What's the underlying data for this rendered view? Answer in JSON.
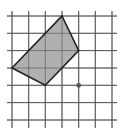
{
  "diagram": {
    "type": "grid-polygon",
    "grid": {
      "x_lines": [
        12,
        28.7,
        45.3,
        62,
        78.7,
        95.3,
        112
      ],
      "y_lines": [
        16,
        33.3,
        50.6,
        68,
        85.3,
        102.6,
        120
      ],
      "x_extent": [
        7,
        117
      ],
      "y_extent": [
        11,
        128
      ],
      "line_color": "#555555",
      "line_width": 0.9
    },
    "polygon": {
      "label": "shaded quadrilateral",
      "points": [
        [
          62,
          16
        ],
        [
          78.7,
          50.6
        ],
        [
          45.3,
          85.3
        ],
        [
          12,
          68
        ]
      ],
      "fill": "#b0b0b0",
      "stroke": "#222222",
      "stroke_width": 1.6
    },
    "point": {
      "label": "marked point",
      "cx": 78.7,
      "cy": 85.3,
      "r": 2.4,
      "fill": "#555555"
    }
  }
}
